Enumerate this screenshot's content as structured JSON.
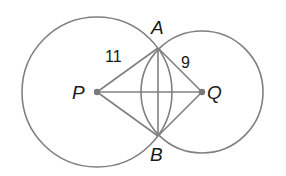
{
  "diagram": {
    "type": "two intersecting circles",
    "points": {
      "P": {
        "label": "P",
        "x": 97,
        "y": 92
      },
      "Q": {
        "label": "Q",
        "x": 202,
        "y": 92
      },
      "A": {
        "label": "A",
        "x": 158,
        "y": 48
      },
      "B": {
        "label": "B",
        "x": 158,
        "y": 136
      }
    },
    "circles": [
      {
        "center": "P",
        "radius": 75
      },
      {
        "center": "Q",
        "radius": 61
      }
    ],
    "segments": [
      "PA",
      "PB",
      "QA",
      "QB",
      "PQ",
      "AB"
    ],
    "measurements": {
      "PA": "11",
      "QA": "9"
    },
    "colors": {
      "stroke": "#808080",
      "point": "#7a7a7a",
      "text": "#1a1a1a"
    }
  }
}
